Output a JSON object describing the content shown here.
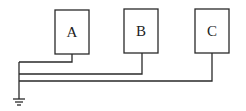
{
  "diagram": {
    "type": "grounding-wiring",
    "colors": {
      "line": "#2a2a2a",
      "background": "#ffffff",
      "text": "#222222"
    },
    "boxes": [
      {
        "id": "A",
        "label": "A",
        "x": 55,
        "y": 10,
        "w": 34,
        "h": 44,
        "lead_x": 72,
        "bus_y": 62
      },
      {
        "id": "B",
        "label": "B",
        "x": 124,
        "y": 9,
        "w": 34,
        "h": 44,
        "lead_x": 142,
        "bus_y": 74
      },
      {
        "id": "C",
        "label": "C",
        "x": 195,
        "y": 9,
        "w": 34,
        "h": 44,
        "lead_x": 212,
        "bus_y": 81
      }
    ],
    "trunk_x": 19,
    "ground": {
      "label": "ground",
      "x": 19,
      "y_top": 62,
      "y_symbol": 98
    }
  }
}
